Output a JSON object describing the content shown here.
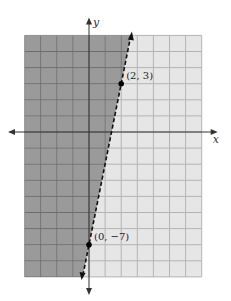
{
  "chart_data": {
    "type": "line",
    "title": "",
    "xlabel": "x",
    "ylabel": "y",
    "xlim": [
      -4,
      7
    ],
    "ylim": [
      -9,
      6
    ],
    "grid": true,
    "series": [
      {
        "name": "boundary line y = 5x - 7",
        "style": "dashed",
        "slope": 5,
        "intercept": -7,
        "points": [
          {
            "x": 2,
            "y": 3,
            "label": "(2, 3)"
          },
          {
            "x": 0,
            "y": -7,
            "label": "(0, −7)"
          }
        ]
      }
    ],
    "shaded_region": "left of line (y > 5x - 7)",
    "colors": {
      "shaded": "#9a9a9a",
      "unshaded": "#e6e6e6",
      "grid": "#6e6e6e",
      "grid_light": "#b4b4b4",
      "line": "#111111"
    }
  },
  "labels": {
    "x_axis": "x",
    "y_axis": "y",
    "point_a": "(2, 3)",
    "point_b": "(0, −7)"
  }
}
